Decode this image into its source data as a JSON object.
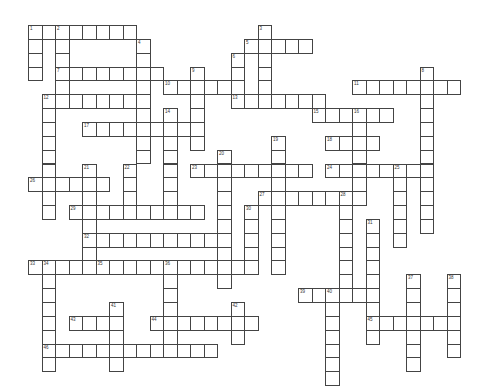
{
  "puzzle": {
    "type": "crossword",
    "grid": {
      "origin_x": 28,
      "origin_y": 25,
      "col_pitch": 13.5,
      "row_pitch": 13.85
    },
    "colors": {
      "cell_border": "#444444",
      "cell_fill": "#ffffff",
      "background": "#ffffff",
      "number": "#333333"
    },
    "across": [
      {
        "number": 1,
        "row": 0,
        "col": 0,
        "length": 8
      },
      {
        "number": 5,
        "row": 1,
        "col": 16,
        "length": 5
      },
      {
        "number": 7,
        "row": 3,
        "col": 2,
        "length": 8
      },
      {
        "number": 10,
        "row": 4,
        "col": 10,
        "length": 6
      },
      {
        "number": 11,
        "row": 4,
        "col": 24,
        "length": 8
      },
      {
        "number": 12,
        "row": 5,
        "col": 1,
        "length": 8
      },
      {
        "number": 13,
        "row": 5,
        "col": 15,
        "length": 7
      },
      {
        "number": 15,
        "row": 6,
        "col": 21,
        "length": 6
      },
      {
        "number": 17,
        "row": 7,
        "col": 4,
        "length": 9
      },
      {
        "number": 18,
        "row": 8,
        "col": 22,
        "length": 4
      },
      {
        "number": 23,
        "row": 10,
        "col": 12,
        "length": 9
      },
      {
        "number": 24,
        "row": 10,
        "col": 22,
        "length": 8
      },
      {
        "number": 26,
        "row": 11,
        "col": 0,
        "length": 6
      },
      {
        "number": 27,
        "row": 12,
        "col": 17,
        "length": 8
      },
      {
        "number": 29,
        "row": 13,
        "col": 3,
        "length": 10
      },
      {
        "number": 32,
        "row": 15,
        "col": 4,
        "length": 11
      },
      {
        "number": 33,
        "row": 17,
        "col": 0,
        "length": 4
      },
      {
        "number": 35,
        "row": 17,
        "col": 5,
        "length": 12
      },
      {
        "number": 39,
        "row": 19,
        "col": 20,
        "length": 6
      },
      {
        "number": 43,
        "row": 21,
        "col": 3,
        "length": 4
      },
      {
        "number": 44,
        "row": 21,
        "col": 9,
        "length": 8
      },
      {
        "number": 45,
        "row": 21,
        "col": 25,
        "length": 7
      },
      {
        "number": 46,
        "row": 23,
        "col": 1,
        "length": 13
      }
    ],
    "down": [
      {
        "number": 1,
        "row": 0,
        "col": 0,
        "length": 4
      },
      {
        "number": 2,
        "row": 0,
        "col": 2,
        "length": 5
      },
      {
        "number": 3,
        "row": 0,
        "col": 17,
        "length": 6
      },
      {
        "number": 4,
        "row": 1,
        "col": 8,
        "length": 9
      },
      {
        "number": 6,
        "row": 2,
        "col": 15,
        "length": 4
      },
      {
        "number": 8,
        "row": 3,
        "col": 29,
        "length": 12
      },
      {
        "number": 9,
        "row": 3,
        "col": 12,
        "length": 6
      },
      {
        "number": 12,
        "row": 5,
        "col": 1,
        "length": 9
      },
      {
        "number": 14,
        "row": 6,
        "col": 10,
        "length": 8
      },
      {
        "number": 16,
        "row": 6,
        "col": 24,
        "length": 7
      },
      {
        "number": 19,
        "row": 8,
        "col": 18,
        "length": 10
      },
      {
        "number": 20,
        "row": 9,
        "col": 14,
        "length": 10
      },
      {
        "number": 21,
        "row": 10,
        "col": 4,
        "length": 8
      },
      {
        "number": 22,
        "row": 10,
        "col": 7,
        "length": 4
      },
      {
        "number": 25,
        "row": 10,
        "col": 27,
        "length": 6
      },
      {
        "number": 28,
        "row": 12,
        "col": 23,
        "length": 8
      },
      {
        "number": 30,
        "row": 13,
        "col": 16,
        "length": 5
      },
      {
        "number": 31,
        "row": 14,
        "col": 25,
        "length": 9
      },
      {
        "number": 34,
        "row": 17,
        "col": 1,
        "length": 8
      },
      {
        "number": 36,
        "row": 17,
        "col": 10,
        "length": 7
      },
      {
        "number": 37,
        "row": 18,
        "col": 28,
        "length": 7
      },
      {
        "number": 38,
        "row": 18,
        "col": 31,
        "length": 6
      },
      {
        "number": 40,
        "row": 19,
        "col": 22,
        "length": 7
      },
      {
        "number": 41,
        "row": 20,
        "col": 6,
        "length": 5
      },
      {
        "number": 42,
        "row": 20,
        "col": 15,
        "length": 3
      }
    ]
  }
}
